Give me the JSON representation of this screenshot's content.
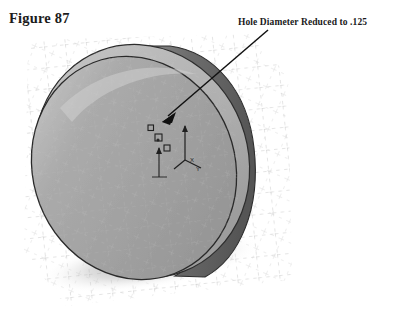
{
  "page": {
    "background_color": "#ffffff",
    "width": 399,
    "height": 317
  },
  "figure": {
    "title": "Figure 87",
    "title_color": "#1c1c1c"
  },
  "annotation": {
    "label": "Hole Diameter Reduced to .125",
    "label_color": "#1a1a1a",
    "leader_line": {
      "from_x": 268,
      "from_y": 30,
      "to_x": 163,
      "to_y": 121,
      "color": "#111111",
      "arrowhead": "filled-triangle"
    }
  },
  "model": {
    "name": "cylindrical-disc-part",
    "description": "Shaded isometric view of a thin cylinder (disc) with a small center hole sketch",
    "colors": {
      "front_face": "#a3a3a3",
      "front_face_highlight": "#b9b9b9",
      "rim_band": "#b2b2b2",
      "side_wall": "#6d6d6d",
      "side_wall_dark": "#565656",
      "outline": "#2a2a2a",
      "shadow": "#9a9a9a",
      "grid_line": "#c9c9c9",
      "sketch_marker": "#1f1f1f"
    },
    "grid": {
      "visible": true,
      "style": "dashed",
      "label": "reference-grid-floor-and-walls"
    },
    "shadow": {
      "visible": true,
      "label": "drop-shadow"
    },
    "origin_triad": {
      "visible": true,
      "axis_labels": [
        "X",
        "Y"
      ],
      "color": "#1f1f1f"
    },
    "sketch_entities": [
      {
        "name": "constraint-marker-1",
        "shape": "small-square",
        "x": 150,
        "y": 129
      },
      {
        "name": "constraint-marker-2",
        "shape": "small-square",
        "x": 157,
        "y": 138
      },
      {
        "name": "constraint-marker-3",
        "shape": "small-square",
        "x": 166,
        "y": 148
      }
    ],
    "dimension_line": {
      "visible": true,
      "label": "center-hole-vertical-dimension"
    }
  }
}
